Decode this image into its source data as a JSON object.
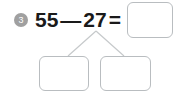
{
  "worksheet": {
    "problem_number": "3",
    "equation": {
      "left_operand": "55",
      "operator": "—",
      "right_operand": "27",
      "equals": "="
    },
    "answer_box": {
      "value": "",
      "placeholder": ""
    },
    "decomposition": {
      "left_part_box": {
        "value": "",
        "placeholder": ""
      },
      "right_part_box": {
        "value": "",
        "placeholder": ""
      }
    },
    "colors": {
      "background": "#ffffff",
      "badge_fill": "#a0a0a0",
      "badge_text": "#ffffff",
      "equation_text": "#1a1a1a",
      "box_border": "#b9bdc0",
      "branch_line": "#c6c9cb"
    }
  }
}
